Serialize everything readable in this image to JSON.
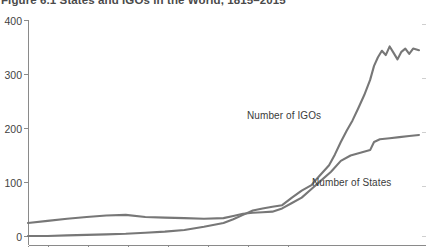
{
  "figure": {
    "title": "Figure 6.1  States and IGOs in the World, 1815–2015"
  },
  "axis": {
    "y_ticks": [
      {
        "label": "400",
        "value": 400
      },
      {
        "label": "300",
        "value": 300
      },
      {
        "label": "200",
        "value": 200
      },
      {
        "label": "100",
        "value": 100
      },
      {
        "label": "0",
        "value": 0
      }
    ]
  },
  "labels": {
    "igos": "Number of IGOs",
    "states": "Number of States"
  },
  "colors": {
    "line": "#777777",
    "axis": "#8a8a8a",
    "text": "#3a3a3a",
    "background": "#ffffff"
  },
  "chart_data": {
    "type": "line",
    "title": "Figure 6.1  States and IGOs in the World, 1815–2015",
    "xlabel": "",
    "ylabel": "",
    "xlim": [
      1815,
      2015
    ],
    "ylim": [
      0,
      400
    ],
    "grid": false,
    "legend": "inline-annotations",
    "ytick_labels": [
      "0",
      "100",
      "200",
      "300",
      "400"
    ],
    "ytick_values": [
      0,
      100,
      200,
      300,
      400
    ],
    "series": [
      {
        "name": "Number of IGOs",
        "x": [
          1815,
          1825,
          1835,
          1845,
          1855,
          1865,
          1875,
          1885,
          1895,
          1905,
          1915,
          1920,
          1925,
          1930,
          1935,
          1940,
          1945,
          1950,
          1955,
          1960,
          1963,
          1966,
          1969,
          1972,
          1975,
          1978,
          1981,
          1984,
          1987,
          1990,
          1992,
          1994,
          1996,
          1998,
          2000,
          2002,
          2004,
          2006,
          2008,
          2010,
          2012,
          2015
        ],
        "y": [
          1,
          1,
          2,
          3,
          4,
          5,
          7,
          9,
          12,
          18,
          25,
          32,
          40,
          48,
          52,
          55,
          58,
          72,
          85,
          95,
          108,
          120,
          132,
          152,
          175,
          196,
          215,
          238,
          262,
          290,
          316,
          332,
          344,
          336,
          352,
          340,
          328,
          342,
          348,
          338,
          348,
          345
        ]
      },
      {
        "name": "Number of States",
        "x": [
          1815,
          1825,
          1835,
          1845,
          1855,
          1865,
          1875,
          1885,
          1895,
          1905,
          1915,
          1920,
          1925,
          1930,
          1935,
          1940,
          1945,
          1950,
          1955,
          1960,
          1965,
          1970,
          1975,
          1980,
          1985,
          1990,
          1992,
          1995,
          2000,
          2005,
          2010,
          2015
        ],
        "y": [
          25,
          29,
          33,
          36,
          39,
          40,
          36,
          35,
          34,
          33,
          34,
          38,
          42,
          44,
          45,
          46,
          52,
          62,
          72,
          88,
          104,
          120,
          140,
          150,
          155,
          160,
          175,
          180,
          182,
          184,
          186,
          188
        ]
      }
    ],
    "annotations": [
      {
        "text": "Number of IGOs",
        "x": 1940,
        "y": 150
      },
      {
        "text": "Number of States",
        "x": 1975,
        "y": 62
      }
    ]
  }
}
